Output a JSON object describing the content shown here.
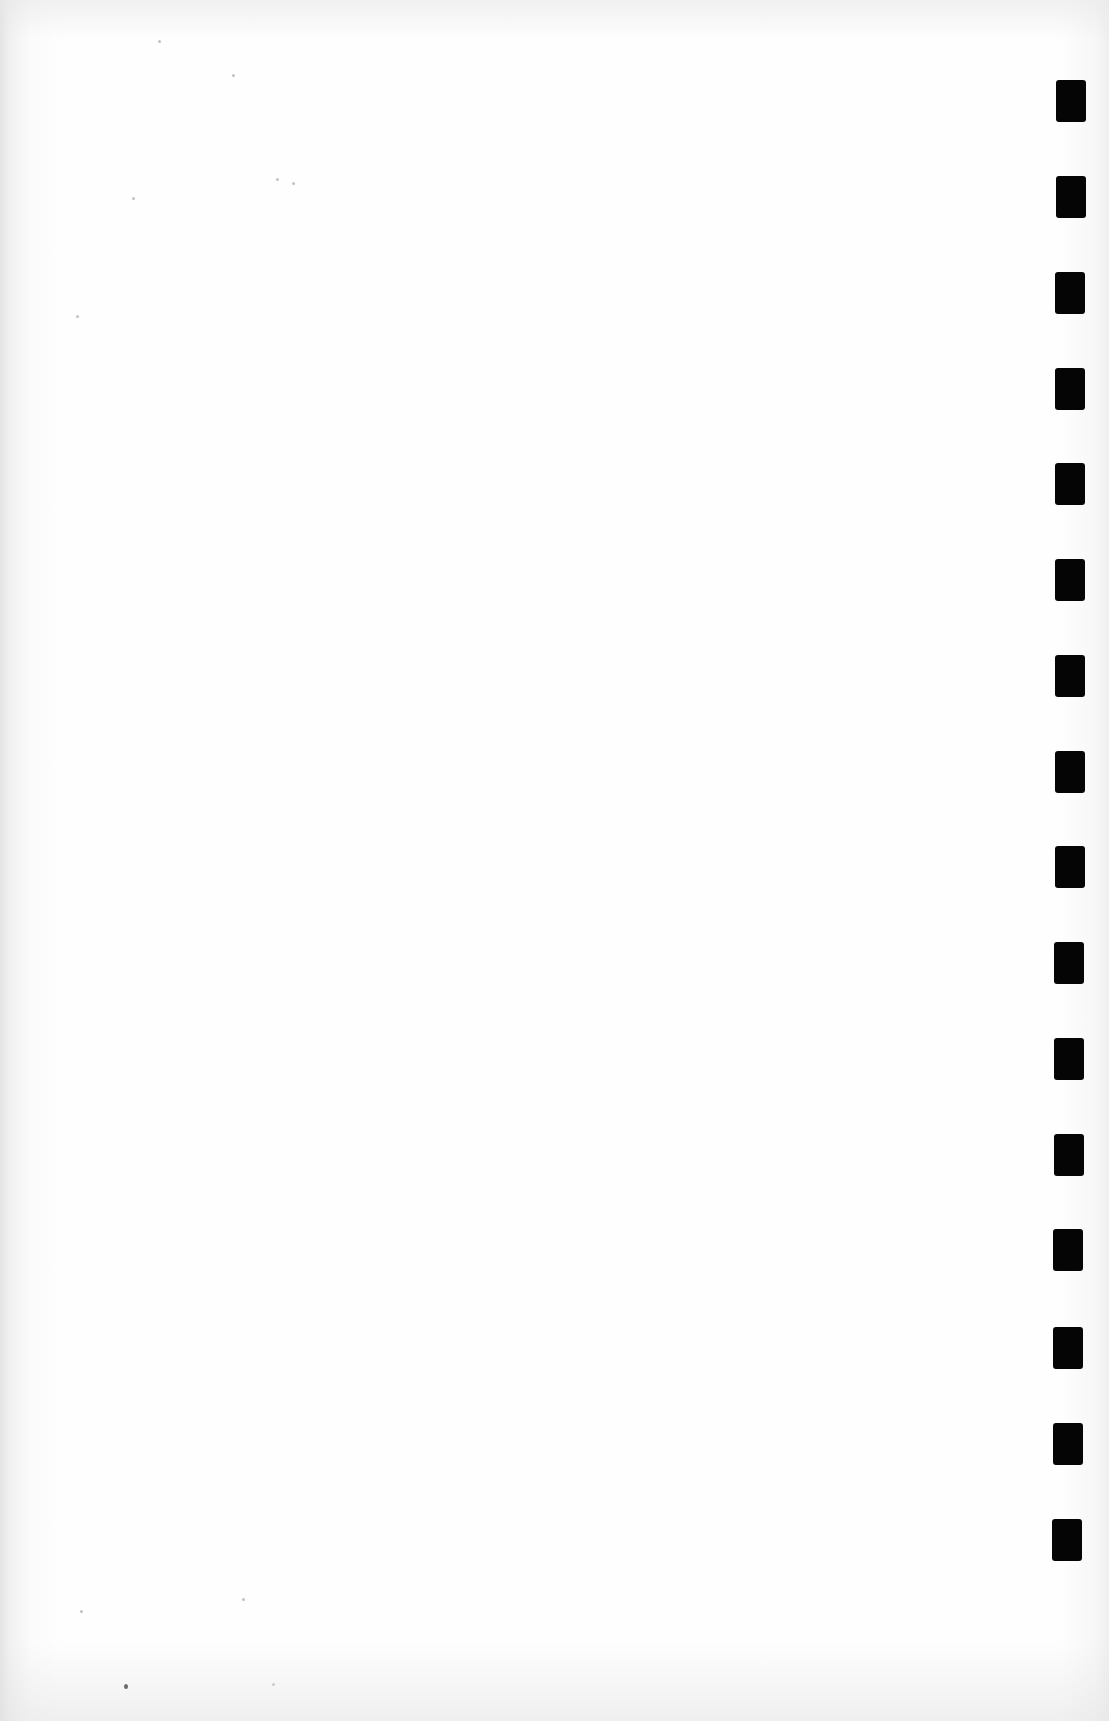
{
  "document": {
    "type": "scanned-blank-page",
    "background_color": "#fefefe",
    "binding_marks": {
      "count": 16,
      "color": "#050505",
      "positions": [
        {
          "x": 1056,
          "y": 80
        },
        {
          "x": 1056,
          "y": 176
        },
        {
          "x": 1055,
          "y": 272
        },
        {
          "x": 1055,
          "y": 368
        },
        {
          "x": 1055,
          "y": 463
        },
        {
          "x": 1055,
          "y": 559
        },
        {
          "x": 1055,
          "y": 655
        },
        {
          "x": 1055,
          "y": 751
        },
        {
          "x": 1055,
          "y": 846
        },
        {
          "x": 1054,
          "y": 942
        },
        {
          "x": 1054,
          "y": 1038
        },
        {
          "x": 1054,
          "y": 1134
        },
        {
          "x": 1053,
          "y": 1229
        },
        {
          "x": 1053,
          "y": 1327
        },
        {
          "x": 1053,
          "y": 1423
        },
        {
          "x": 1052,
          "y": 1519
        }
      ]
    },
    "specks": [
      {
        "x": 132,
        "y": 197,
        "dark": false
      },
      {
        "x": 158,
        "y": 40,
        "dark": false
      },
      {
        "x": 276,
        "y": 178,
        "dark": false
      },
      {
        "x": 292,
        "y": 182,
        "dark": false
      },
      {
        "x": 232,
        "y": 74,
        "dark": false
      },
      {
        "x": 76,
        "y": 315,
        "dark": false
      },
      {
        "x": 124,
        "y": 1684,
        "dark": true
      },
      {
        "x": 242,
        "y": 1598,
        "dark": false
      },
      {
        "x": 272,
        "y": 1683,
        "dark": false
      },
      {
        "x": 80,
        "y": 1610,
        "dark": false
      }
    ]
  }
}
